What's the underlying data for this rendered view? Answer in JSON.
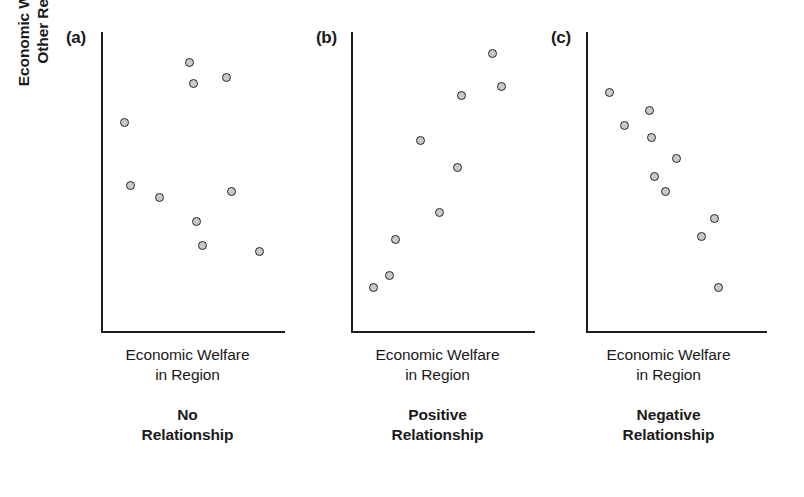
{
  "figure": {
    "shared_y_axis_label_line1": "Economic Welfare in",
    "shared_y_axis_label_line2": "Other Regions",
    "marker_fill_color": "#c9c9c9",
    "marker_edge_color": "#262626",
    "axis_color": "#1d1d1d",
    "background_color": "#ffffff"
  },
  "chart_data": [
    {
      "type": "scatter",
      "panel_tag": "(a)",
      "title": "No Relationship",
      "caption_line1": "No",
      "caption_line2": "Relationship",
      "xlabel_line1": "Economic Welfare",
      "xlabel_line2": "in Region",
      "xlabel": "Economic Welfare in Region",
      "ylabel": "Economic Welfare in Other Regions",
      "xlim": [
        0,
        1
      ],
      "ylim": [
        0,
        1
      ],
      "grid": false,
      "ticks": false,
      "legend": "none",
      "n_points": 9,
      "x": [
        0.13,
        0.16,
        0.32,
        0.48,
        0.5,
        0.52,
        0.55,
        0.68,
        0.71,
        0.86
      ],
      "y": [
        0.7,
        0.49,
        0.45,
        0.9,
        0.83,
        0.37,
        0.29,
        0.85,
        0.47,
        0.27
      ],
      "points": [
        {
          "x": 0.13,
          "y": 0.7
        },
        {
          "x": 0.16,
          "y": 0.49
        },
        {
          "x": 0.32,
          "y": 0.45
        },
        {
          "x": 0.48,
          "y": 0.9
        },
        {
          "x": 0.5,
          "y": 0.83
        },
        {
          "x": 0.52,
          "y": 0.37
        },
        {
          "x": 0.55,
          "y": 0.29
        },
        {
          "x": 0.68,
          "y": 0.85
        },
        {
          "x": 0.71,
          "y": 0.47
        },
        {
          "x": 0.86,
          "y": 0.27
        }
      ]
    },
    {
      "type": "scatter",
      "panel_tag": "(b)",
      "title": "Positive Relationship",
      "caption_line1": "Positive",
      "caption_line2": "Relationship",
      "xlabel_line1": "Economic Welfare",
      "xlabel_line2": "in Region",
      "xlabel": "Economic Welfare in Region",
      "ylabel": "Economic Welfare in Other Regions",
      "xlim": [
        0,
        1
      ],
      "ylim": [
        0,
        1
      ],
      "grid": false,
      "ticks": false,
      "legend": "none",
      "n_points": 9,
      "x": [
        0.12,
        0.21,
        0.24,
        0.38,
        0.48,
        0.58,
        0.6,
        0.77,
        0.82
      ],
      "y": [
        0.15,
        0.19,
        0.31,
        0.64,
        0.4,
        0.55,
        0.79,
        0.93,
        0.82
      ],
      "points": [
        {
          "x": 0.12,
          "y": 0.15
        },
        {
          "x": 0.21,
          "y": 0.19
        },
        {
          "x": 0.24,
          "y": 0.31
        },
        {
          "x": 0.38,
          "y": 0.64
        },
        {
          "x": 0.48,
          "y": 0.4
        },
        {
          "x": 0.58,
          "y": 0.55
        },
        {
          "x": 0.6,
          "y": 0.79
        },
        {
          "x": 0.77,
          "y": 0.93
        },
        {
          "x": 0.82,
          "y": 0.82
        }
      ]
    },
    {
      "type": "scatter",
      "panel_tag": "(c)",
      "title": "Negative Relationship",
      "caption_line1": "Negative",
      "caption_line2": "Relationship",
      "xlabel_line1": "Economic Welfare",
      "xlabel_line2": "in Region",
      "xlabel": "Economic Welfare in Region",
      "ylabel": "Economic Welfare in Other Regions",
      "xlim": [
        0,
        1
      ],
      "ylim": [
        0,
        1
      ],
      "grid": false,
      "ticks": false,
      "legend": "none",
      "n_points": 9,
      "x": [
        0.13,
        0.21,
        0.35,
        0.36,
        0.38,
        0.44,
        0.5,
        0.64,
        0.71,
        0.73
      ],
      "y": [
        0.8,
        0.69,
        0.74,
        0.65,
        0.52,
        0.47,
        0.58,
        0.32,
        0.38,
        0.15
      ],
      "points": [
        {
          "x": 0.13,
          "y": 0.8
        },
        {
          "x": 0.21,
          "y": 0.69
        },
        {
          "x": 0.35,
          "y": 0.74
        },
        {
          "x": 0.36,
          "y": 0.65
        },
        {
          "x": 0.38,
          "y": 0.52
        },
        {
          "x": 0.44,
          "y": 0.47
        },
        {
          "x": 0.5,
          "y": 0.58
        },
        {
          "x": 0.64,
          "y": 0.32
        },
        {
          "x": 0.71,
          "y": 0.38
        },
        {
          "x": 0.73,
          "y": 0.15
        }
      ]
    }
  ]
}
